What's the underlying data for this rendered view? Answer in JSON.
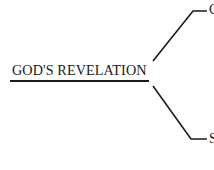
{
  "diagram": {
    "root": {
      "label": "GOD'S REVELATION"
    },
    "branches": [
      {
        "label": "G",
        "position": "upper"
      },
      {
        "label": "S",
        "position": "lower"
      }
    ]
  }
}
